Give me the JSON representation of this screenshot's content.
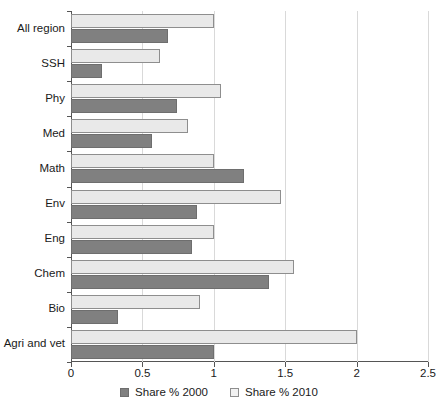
{
  "chart_data": {
    "type": "bar",
    "orientation": "horizontal",
    "title": "",
    "xlabel": "",
    "ylabel": "",
    "xlim": [
      0,
      2.5
    ],
    "xticks": [
      0,
      0.5,
      1,
      1.5,
      2,
      2.5
    ],
    "xtick_labels": [
      "0",
      "0.5",
      "1",
      "1.5",
      "2",
      "2.5"
    ],
    "grid": "vertical",
    "legend_position": "bottom",
    "categories": [
      "All region",
      "SSH",
      "Phy",
      "Med",
      "Math",
      "Env",
      "Eng",
      "Chem",
      "Bio",
      "Agri and vet"
    ],
    "series": [
      {
        "name": "Share % 2000",
        "color": "#808080",
        "values": [
          0.68,
          0.22,
          0.74,
          0.57,
          1.21,
          0.88,
          0.85,
          1.39,
          0.33,
          1.0
        ]
      },
      {
        "name": "Share % 2010",
        "color": "#e9e9e9",
        "values": [
          1.0,
          0.62,
          1.05,
          0.82,
          1.0,
          1.47,
          1.0,
          1.56,
          0.9,
          2.0
        ]
      }
    ]
  },
  "legend": {
    "items": [
      {
        "label": "Share % 2000",
        "swatch": "dark"
      },
      {
        "label": "Share % 2010",
        "swatch": "light"
      }
    ]
  }
}
